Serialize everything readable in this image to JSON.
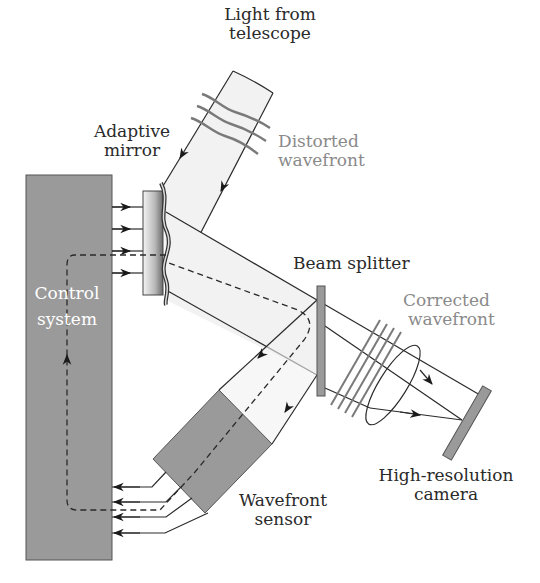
{
  "figure": {
    "labels": {
      "light_source": [
        "Light from",
        "telescope"
      ],
      "distorted": [
        "Distorted",
        "wavefront"
      ],
      "adaptive_mirror": [
        "Adaptive",
        "mirror"
      ],
      "beam_splitter": "Beam splitter",
      "corrected": [
        "Corrected",
        "wavefront"
      ],
      "control_system": [
        "Control",
        "system"
      ],
      "camera": [
        "High-resolution",
        "camera"
      ],
      "sensor": [
        "Wavefront",
        "sensor"
      ]
    },
    "colors": {
      "component_fill": "#9a9a9a",
      "beam_fill": "#f2f2f2",
      "line": "#2a2a2a",
      "grey_label": "#8a8a8a"
    },
    "components": [
      "Control system",
      "Adaptive mirror",
      "Beam splitter",
      "Wavefront sensor",
      "Lens",
      "High-resolution camera"
    ]
  }
}
